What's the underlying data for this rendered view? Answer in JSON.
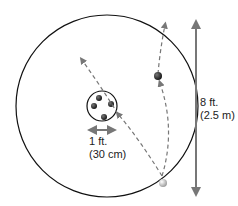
{
  "diagram": {
    "inner_circle_label": {
      "line1": "1 ft.",
      "line2": "(30 cm)"
    },
    "outer_dimension_label": {
      "line1": "8 ft.",
      "line2": "(2.5 m)"
    },
    "colors": {
      "outline": "#111111",
      "arrow": "#777777",
      "dark_ball": "#222222",
      "light_ball": "#cccccc"
    }
  }
}
